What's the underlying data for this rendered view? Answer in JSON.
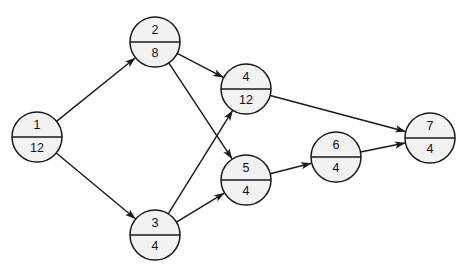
{
  "figure": {
    "kind": "directed-network-diagram",
    "background_color": "#ffffff",
    "node_fill_color": "#f2f2f2",
    "stroke_color": "#1a1a1a",
    "node_radius": 25
  },
  "nodes": [
    {
      "id": "1",
      "label": "1",
      "value": "12",
      "cx": 37,
      "cy": 137
    },
    {
      "id": "2",
      "label": "2",
      "value": "8",
      "cx": 155,
      "cy": 42
    },
    {
      "id": "3",
      "label": "3",
      "value": "4",
      "cx": 155,
      "cy": 235
    },
    {
      "id": "4",
      "label": "4",
      "value": "12",
      "cx": 246,
      "cy": 89
    },
    {
      "id": "5",
      "label": "5",
      "value": "4",
      "cx": 246,
      "cy": 180
    },
    {
      "id": "6",
      "label": "6",
      "value": "4",
      "cx": 336,
      "cy": 157
    },
    {
      "id": "7",
      "label": "7",
      "value": "4",
      "cx": 430,
      "cy": 138
    }
  ],
  "edges": [
    {
      "from": "1",
      "to": "2"
    },
    {
      "from": "1",
      "to": "3"
    },
    {
      "from": "2",
      "to": "4"
    },
    {
      "from": "2",
      "to": "5"
    },
    {
      "from": "3",
      "to": "4"
    },
    {
      "from": "3",
      "to": "5"
    },
    {
      "from": "5",
      "to": "6"
    },
    {
      "from": "4",
      "to": "7"
    },
    {
      "from": "6",
      "to": "7"
    }
  ]
}
